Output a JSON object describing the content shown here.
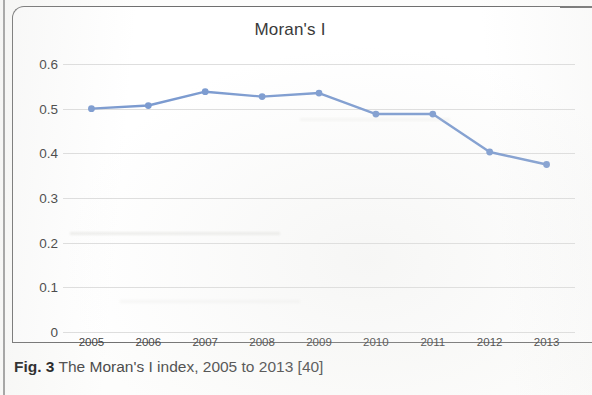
{
  "figure": {
    "caption_label": "Fig. 3",
    "caption_text": "The Moran's I index, 2005 to 2013 [40]"
  },
  "chart_data": {
    "type": "line",
    "title": "Moran's I",
    "xlabel": "",
    "ylabel": "",
    "categories": [
      "2005",
      "2006",
      "2007",
      "2008",
      "2009",
      "2010",
      "2011",
      "2012",
      "2013"
    ],
    "values": [
      0.5,
      0.507,
      0.538,
      0.527,
      0.535,
      0.488,
      0.488,
      0.403,
      0.375
    ],
    "series": [
      {
        "name": "Moran's I",
        "values": [
          0.5,
          0.507,
          0.538,
          0.527,
          0.535,
          0.488,
          0.488,
          0.403,
          0.375
        ]
      }
    ],
    "ylim": [
      0,
      0.6
    ],
    "ytick_labels": [
      "0.6",
      "0.5",
      "0.4",
      "0.3",
      "0.2",
      "0.1",
      "0"
    ],
    "ytick_values": [
      0.6,
      0.5,
      0.4,
      0.3,
      0.2,
      0.1,
      0
    ],
    "grid": true,
    "legend": false,
    "legend_position": "none",
    "marker": "circle",
    "line_color": "#7c9bd0",
    "marker_color": "#7c9bd0",
    "gridline_color": "#dcdcdc"
  }
}
